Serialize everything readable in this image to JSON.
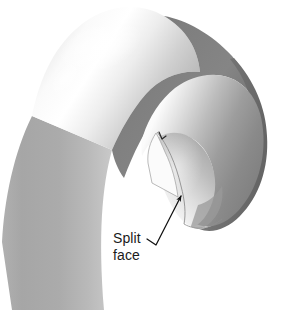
{
  "figure": {
    "name": "split-face-cad-illustration",
    "type": "3d-solid-model-diagram",
    "background_color": "#ffffff"
  },
  "annotations": {
    "callout": {
      "name": "split-face-callout",
      "line1": "Split",
      "line2": "face",
      "leader": {
        "name": "leader-line",
        "has_arrowhead": true,
        "arrow_target_x": 181,
        "arrow_target_y": 195,
        "elbow_x": 156,
        "elbow_y": 245,
        "dash_start_x": 147,
        "dash_start_y": 239
      }
    },
    "tick_mark": {
      "name": "edge-tick-mark",
      "visible": true
    }
  },
  "geometry": {
    "parts": [
      {
        "name": "hook-body-outer",
        "shade": "light-gray-gradient"
      },
      {
        "name": "shadow-band-crescent",
        "shade": "dark-gray"
      },
      {
        "name": "bulb-inner-surface",
        "shade": "white-to-dark-gradient"
      },
      {
        "name": "bulb-rim-right",
        "shade": "dark-gray"
      },
      {
        "name": "split-face-quad",
        "shade": "near-white"
      },
      {
        "name": "tube-lower-shaft",
        "shade": "mid-gray-gradient"
      }
    ]
  },
  "colors": {
    "paper": "#ffffff",
    "body_light": "#f4f4f4",
    "body_mid": "#bdbdbd",
    "body_dark": "#a8a8a8",
    "band_dark": "#7b7b7b",
    "band_darker": "#6e6e6e",
    "rim_dark": "#6a6a6a",
    "split_face": "#fbfbfb",
    "outline": "#8c8c8c",
    "label_text": "#1b1b1b",
    "leader_line": "#111111"
  }
}
